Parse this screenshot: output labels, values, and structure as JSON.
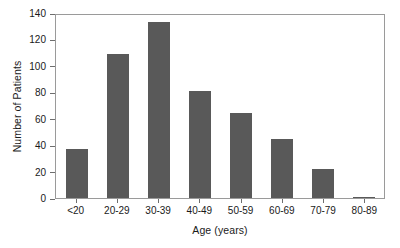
{
  "chart_data": {
    "type": "bar",
    "title": "",
    "xlabel": "Age (years)",
    "ylabel": "Number of Patients",
    "categories": [
      "<20",
      "20-29",
      "30-39",
      "40-49",
      "50-59",
      "60-69",
      "70-79",
      "80-89"
    ],
    "values": [
      37,
      109,
      133,
      81,
      64,
      45,
      22,
      1
    ],
    "ylim": [
      0,
      140
    ],
    "yticks": [
      0,
      20,
      40,
      60,
      80,
      100,
      120,
      140
    ],
    "ytick_labels": [
      "0",
      "20",
      "40",
      "60",
      "80",
      "100",
      "120",
      "140"
    ],
    "grid": false,
    "legend": null,
    "bar_color": "#595959",
    "frame_color": "#9a9a9a",
    "background_color": "#ffffff",
    "series": [
      {
        "name": "Number of Patients",
        "values": [
          37,
          109,
          133,
          81,
          64,
          45,
          22,
          1
        ]
      }
    ]
  }
}
